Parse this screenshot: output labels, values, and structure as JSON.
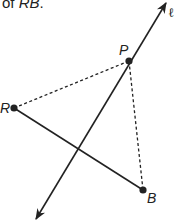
{
  "caption": {
    "prefix": "of ",
    "segment": "RB",
    "suffix": "."
  },
  "diagram": {
    "line_label": "ℓ",
    "points": {
      "P": "P",
      "R": "R",
      "B": "B"
    },
    "segments": [
      {
        "from": "R",
        "to": "B",
        "style": "solid"
      },
      {
        "from": "R",
        "to": "P",
        "style": "dashed"
      },
      {
        "from": "P",
        "to": "B",
        "style": "dashed"
      }
    ],
    "line": {
      "name": "ℓ",
      "through": "P",
      "arrows": "both"
    },
    "colors": {
      "ink": "#222222"
    }
  }
}
